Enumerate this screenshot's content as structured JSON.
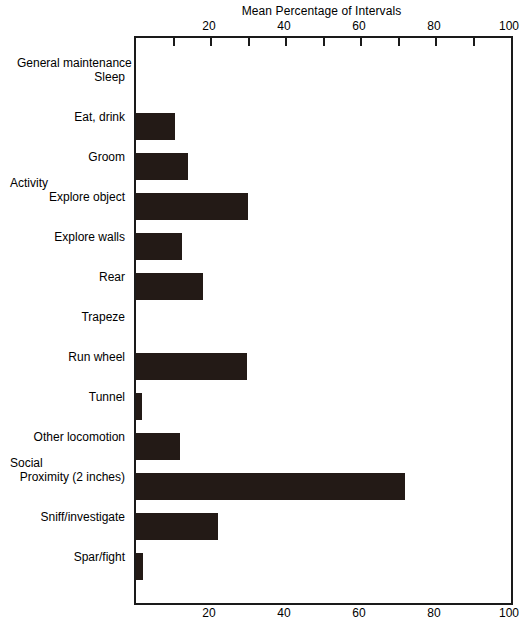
{
  "chart_data": {
    "type": "bar",
    "orientation": "horizontal",
    "title": "Mean Percentage of Intervals",
    "xlabel": "",
    "ylabel": "",
    "xlim": [
      0,
      100
    ],
    "xticks": [
      0,
      10,
      20,
      30,
      40,
      50,
      60,
      70,
      80,
      90,
      100
    ],
    "xtick_labels": [
      "20",
      "40",
      "60",
      "80",
      "100"
    ],
    "xtick_label_values": [
      20,
      40,
      60,
      80,
      100
    ],
    "grid": false,
    "legend": false,
    "bar_color": "#231a16",
    "axis_color": "#1a1a1a",
    "background": "#ffffff",
    "groups": [
      {
        "name": "General maintenance",
        "items": [
          {
            "label": "Sleep",
            "value": 0
          },
          {
            "label": "Eat, drink",
            "value": 10.4
          },
          {
            "label": "Groom",
            "value": 13.9
          }
        ]
      },
      {
        "name": "Activity",
        "items": [
          {
            "label": "Explore object",
            "value": 29.9
          },
          {
            "label": "Explore walls",
            "value": 12.3
          },
          {
            "label": "Rear",
            "value": 17.8
          },
          {
            "label": "Trapeze",
            "value": 0
          },
          {
            "label": "Run wheel",
            "value": 29.6
          },
          {
            "label": "Tunnel",
            "value": 1.6
          },
          {
            "label": "Other locomotion",
            "value": 11.7
          }
        ]
      },
      {
        "name": "Social",
        "items": [
          {
            "label": "Proximity (2 inches)",
            "value": 71.7
          },
          {
            "label": "Sniff/investigate",
            "value": 21.9
          },
          {
            "label": "Spar/fight",
            "value": 1.9
          }
        ]
      }
    ],
    "categories": [
      "Sleep",
      "Eat, drink",
      "Groom",
      "Explore object",
      "Explore walls",
      "Rear",
      "Trapeze",
      "Run wheel",
      "Tunnel",
      "Other locomotion",
      "Proximity (2 inches)",
      "Sniff/investigate",
      "Spar/fight"
    ],
    "values": [
      0,
      10.4,
      13.9,
      29.9,
      12.3,
      17.8,
      0,
      29.6,
      1.6,
      11.7,
      71.7,
      21.9,
      1.9
    ]
  }
}
